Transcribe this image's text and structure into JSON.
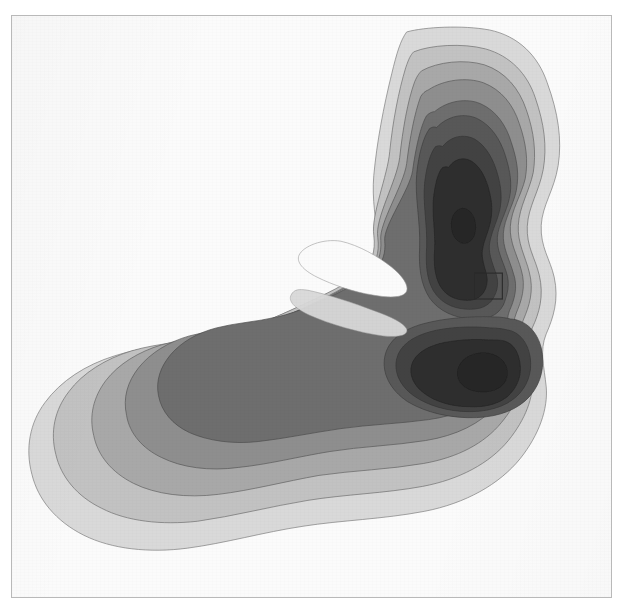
{
  "figure": {
    "title": "",
    "background_color": "#ffffff",
    "plot_background_color": "#fbfbfb",
    "frame_color": "#b9b9b9",
    "frame": {
      "x": 11,
      "y": 15,
      "width": 601,
      "height": 583
    }
  },
  "chart_data": {
    "type": "heatmap",
    "subtype": "filled-contour",
    "title": "",
    "xlabel": "",
    "ylabel": "",
    "grid": false,
    "legend": "none",
    "axis_ticks": "none",
    "colormap": "grayscale-discrete",
    "level_count": 8,
    "levels": [
      {
        "index": 0,
        "label": "background",
        "color": "#fbfbfb"
      },
      {
        "index": 1,
        "label": "level-1",
        "color": "#d9d9d9"
      },
      {
        "index": 2,
        "label": "level-2",
        "color": "#c2c2c2"
      },
      {
        "index": 3,
        "label": "level-3",
        "color": "#a8a8a8"
      },
      {
        "index": 4,
        "label": "level-4",
        "color": "#8e8e8e"
      },
      {
        "index": 5,
        "label": "level-5",
        "color": "#6e6e6e"
      },
      {
        "index": 6,
        "label": "level-6",
        "color": "#585858"
      },
      {
        "index": 7,
        "label": "level-7",
        "color": "#434343"
      },
      {
        "index": 8,
        "label": "level-8",
        "color": "#2e2e2e"
      }
    ],
    "contour_line_color": "#3a3a3a",
    "contour_line_width": 0.7,
    "peaks": [
      {
        "name": "upper-peak",
        "x": 470,
        "y": 219,
        "level": 8
      },
      {
        "name": "lower-right-peak",
        "x": 498,
        "y": 371,
        "level": 8
      },
      {
        "name": "left-tail-ridge",
        "x": 215,
        "y": 432,
        "level": 5
      }
    ],
    "saddle": {
      "name": "saddle-between-lobes",
      "x": 489,
      "y": 292
    },
    "marker_rectangle": {
      "name": "region-of-interest",
      "x": 464,
      "y": 258,
      "width": 28,
      "height": 26,
      "stroke": "#2c2c2c",
      "stroke_width": 1.2,
      "fill": "none"
    }
  }
}
